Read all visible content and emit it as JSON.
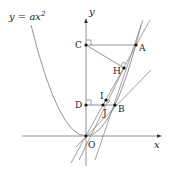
{
  "diagram": {
    "curve_label": "y = ax",
    "curve_exponent": "2",
    "axis_labels": {
      "x": "x",
      "y": "y"
    },
    "points": {
      "O": {
        "label": "O",
        "x": 86,
        "y": 136
      },
      "A": {
        "label": "A",
        "x": 136,
        "y": 45
      },
      "B": {
        "label": "B",
        "x": 115,
        "y": 105
      },
      "C": {
        "label": "C",
        "x": 86,
        "y": 45
      },
      "D": {
        "label": "D",
        "x": 86,
        "y": 105
      },
      "H": {
        "label": "H",
        "x": 124,
        "y": 68
      },
      "I": {
        "label": "I",
        "x": 106,
        "y": 100
      },
      "J": {
        "label": "J",
        "x": 103,
        "y": 105
      }
    },
    "colors": {
      "line": "#777777",
      "point": "#111111",
      "text": "#222222"
    }
  }
}
